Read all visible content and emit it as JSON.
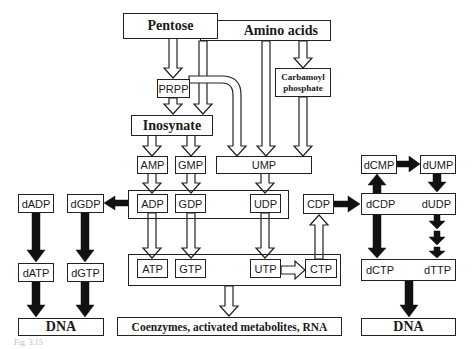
{
  "diagram": {
    "sources": {
      "pentose": "Pentose",
      "amino_acids": "Amino acids",
      "carbamoyl_phosphate": "Carbamoyl phosphate",
      "carbamoyl_line1": "Carbamoyl",
      "carbamoyl_line2": "phosphate"
    },
    "intermediates": {
      "prpp": "PRPP",
      "inosynate": "Inosynate",
      "amp": "AMP",
      "gmp": "GMP",
      "ump": "UMP"
    },
    "diphosphates": {
      "adp": "ADP",
      "gdp": "GDP",
      "udp": "UDP",
      "cdp": "CDP"
    },
    "triphosphates": {
      "atp": "ATP",
      "gtp": "GTP",
      "utp": "UTP",
      "ctp": "CTP"
    },
    "deoxy_purines": {
      "dadp": "dADP",
      "dgdp": "dGDP",
      "datp": "dATP",
      "dgtp": "dGTP"
    },
    "deoxy_pyrimidines": {
      "dcmp": "dCMP",
      "dump": "dUMP",
      "dcdp": "dCDP",
      "dudp": "dUDP",
      "dctp": "dCTP",
      "dttp": "dTTP"
    },
    "outputs": {
      "dna_left": "DNA",
      "rna_products": "Coenzymes, activated metabolites, RNA",
      "dna_right": "DNA"
    },
    "caption": "Fig. 3.15"
  },
  "edges": [
    {
      "from": "Pentose",
      "to": "PRPP",
      "style": "hollow"
    },
    {
      "from": "Amino acids",
      "to": "Inosynate",
      "style": "hollow"
    },
    {
      "from": "Amino acids",
      "to": "UMP",
      "style": "hollow"
    },
    {
      "from": "Amino acids",
      "to": "Carbamoyl phosphate",
      "style": "hollow"
    },
    {
      "from": "PRPP",
      "to": "Inosynate",
      "style": "hollow"
    },
    {
      "from": "PRPP",
      "to": "UMP",
      "style": "hollow"
    },
    {
      "from": "Carbamoyl phosphate",
      "to": "UMP",
      "style": "hollow"
    },
    {
      "from": "Inosynate",
      "to": "AMP",
      "style": "hollow"
    },
    {
      "from": "Inosynate",
      "to": "GMP",
      "style": "hollow"
    },
    {
      "from": "AMP",
      "to": "ADP",
      "style": "hollow"
    },
    {
      "from": "GMP",
      "to": "GDP",
      "style": "hollow"
    },
    {
      "from": "UMP",
      "to": "UDP",
      "style": "hollow"
    },
    {
      "from": "ADP",
      "to": "ATP",
      "style": "hollow"
    },
    {
      "from": "GDP",
      "to": "GTP",
      "style": "hollow"
    },
    {
      "from": "UDP",
      "to": "UTP",
      "style": "hollow"
    },
    {
      "from": "UTP",
      "to": "CTP",
      "style": "hollow"
    },
    {
      "from": "CTP",
      "to": "CDP",
      "style": "hollow"
    },
    {
      "from": "NTP pool",
      "to": "Coenzymes, activated metabolites, RNA",
      "style": "hollow"
    },
    {
      "from": "ADP/GDP",
      "to": "dGDP/dADP",
      "style": "solid"
    },
    {
      "from": "dADP",
      "to": "dATP",
      "style": "solid"
    },
    {
      "from": "dGDP",
      "to": "dGTP",
      "style": "solid"
    },
    {
      "from": "dATP",
      "to": "DNA",
      "style": "solid"
    },
    {
      "from": "dGTP",
      "to": "DNA",
      "style": "solid"
    },
    {
      "from": "CDP",
      "to": "dCDP",
      "style": "solid"
    },
    {
      "from": "dCDP",
      "to": "dCMP",
      "style": "solid"
    },
    {
      "from": "dCMP",
      "to": "dUMP",
      "style": "solid"
    },
    {
      "from": "dUMP",
      "to": "dUDP",
      "style": "solid"
    },
    {
      "from": "dCDP",
      "to": "dCTP",
      "style": "solid"
    },
    {
      "from": "dUDP",
      "to": "dTTP",
      "style": "solid-multistep"
    },
    {
      "from": "dCTP/dTTP",
      "to": "DNA",
      "style": "solid"
    }
  ]
}
